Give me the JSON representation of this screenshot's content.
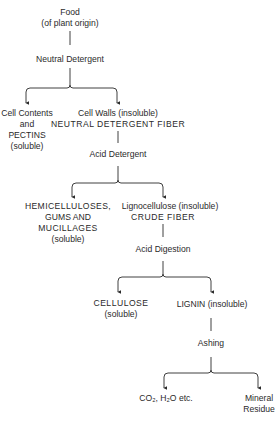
{
  "diagram": {
    "colors": {
      "ink": "#2a2a2a",
      "background": "#ffffff"
    },
    "nodes": {
      "food": {
        "line1": "Food",
        "line2": "(of plant origin)"
      },
      "neutral_detergent": {
        "label": "Neutral Detergent"
      },
      "cell_contents": {
        "line1": "Cell Contents",
        "line2": "and",
        "line3": "PECTINS",
        "line4": "(soluble)"
      },
      "cell_walls": {
        "line1": "Cell Walls (insoluble)",
        "line2": "NEUTRAL DETERGENT FIBER"
      },
      "acid_detergent": {
        "label": "Acid Detergent"
      },
      "hemicelluloses": {
        "line1": "HEMICELLULOSES,",
        "line2": "GUMS AND",
        "line3": "MUCILLAGES",
        "line4": "(soluble)"
      },
      "lignocellulose": {
        "line1": "Lignocellulose (insoluble)",
        "line2": "CRUDE FIBER"
      },
      "acid_digestion": {
        "label": "Acid Digestion"
      },
      "cellulose": {
        "line1": "CELLULOSE",
        "line2": "(soluble)"
      },
      "lignin": {
        "label": "LIGNIN (insoluble)"
      },
      "ashing": {
        "label": "Ashing"
      },
      "co2_h2o": {
        "label": "CO₂, H₂O etc."
      },
      "mineral_residue": {
        "line1": "Mineral",
        "line2": "Residue"
      }
    },
    "edges": [
      {
        "from": "food",
        "to": "neutral_detergent"
      },
      {
        "from": "neutral_detergent",
        "to": "cell_contents"
      },
      {
        "from": "neutral_detergent",
        "to": "cell_walls"
      },
      {
        "from": "cell_walls",
        "to": "acid_detergent"
      },
      {
        "from": "acid_detergent",
        "to": "hemicelluloses"
      },
      {
        "from": "acid_detergent",
        "to": "lignocellulose"
      },
      {
        "from": "lignocellulose",
        "to": "acid_digestion"
      },
      {
        "from": "acid_digestion",
        "to": "cellulose"
      },
      {
        "from": "acid_digestion",
        "to": "lignin"
      },
      {
        "from": "lignin",
        "to": "ashing"
      },
      {
        "from": "ashing",
        "to": "co2_h2o"
      },
      {
        "from": "ashing",
        "to": "mineral_residue"
      }
    ]
  }
}
